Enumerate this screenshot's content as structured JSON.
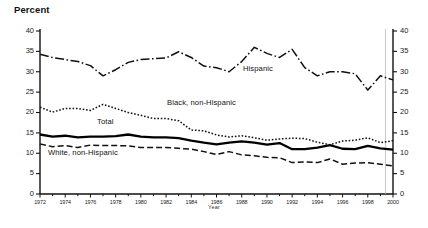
{
  "chart_data": {
    "type": "line",
    "title": "",
    "ylabel": "Percent",
    "xlabel": "Year",
    "ylim": [
      0,
      40
    ],
    "xlim": [
      1972,
      2000
    ],
    "ytick_labels": [
      "40",
      "35",
      "30",
      "25",
      "20",
      "15",
      "10",
      "5",
      "0"
    ],
    "ytick_values": [
      40,
      35,
      30,
      25,
      20,
      15,
      10,
      5,
      0
    ],
    "right_axis": true,
    "right_ytick_labels": [
      "40",
      "35",
      "30",
      "25",
      "20",
      "15",
      "10",
      "5",
      "0"
    ],
    "xtick_labels": [
      "1972",
      "1974",
      "1976",
      "1978",
      "1980",
      "1982",
      "1984",
      "1986",
      "1988",
      "1990",
      "1992",
      "1994",
      "1996",
      "1998",
      "2000"
    ],
    "xtick_values": [
      1972,
      1974,
      1976,
      1978,
      1980,
      1982,
      1984,
      1986,
      1988,
      1990,
      1992,
      1994,
      1996,
      1998,
      2000
    ],
    "grid": false,
    "legend_position": "inline-annotations",
    "x": [
      1972,
      1973,
      1974,
      1975,
      1976,
      1977,
      1978,
      1979,
      1980,
      1981,
      1982,
      1983,
      1984,
      1985,
      1986,
      1987,
      1988,
      1989,
      1990,
      1991,
      1992,
      1993,
      1994,
      1995,
      1996,
      1997,
      1998,
      1999,
      2000
    ],
    "series": [
      {
        "name": "Hispanic",
        "label": "Hispanic",
        "style": "dash-dot",
        "color": "#111111",
        "values": [
          34.3,
          33.5,
          33.0,
          32.5,
          31.5,
          29.0,
          30.5,
          32.3,
          33.0,
          33.2,
          33.4,
          34.9,
          33.5,
          31.4,
          31.0,
          30.0,
          32.5,
          36.0,
          34.5,
          33.5,
          35.5,
          31.0,
          29.0,
          30.0,
          30.0,
          29.5,
          25.5,
          29.0,
          28.0
        ]
      },
      {
        "name": "Black, non-Hispanic",
        "label": "Black, non-Hispanic",
        "style": "dotted",
        "color": "#111111",
        "values": [
          21.3,
          20.1,
          21.0,
          21.0,
          20.5,
          22.0,
          21.0,
          20.0,
          19.3,
          18.5,
          18.5,
          18.0,
          15.7,
          15.5,
          14.5,
          14.0,
          14.3,
          13.8,
          13.2,
          13.5,
          13.7,
          13.6,
          12.7,
          12.1,
          13.0,
          13.2,
          13.8,
          12.6,
          13.1
        ]
      },
      {
        "name": "Total",
        "label": "Total",
        "style": "solid-thick",
        "color": "#000000",
        "values": [
          14.6,
          14.1,
          14.3,
          13.9,
          14.1,
          14.1,
          14.2,
          14.6,
          14.1,
          13.9,
          13.9,
          13.7,
          13.1,
          12.6,
          12.2,
          12.6,
          12.9,
          12.6,
          12.1,
          12.5,
          11.0,
          11.0,
          11.4,
          12.0,
          11.1,
          11.0,
          11.8,
          11.2,
          10.9
        ]
      },
      {
        "name": "White, non-Hispanic",
        "label": "White, non-Hispanic",
        "style": "dashed",
        "color": "#111111",
        "values": [
          12.3,
          11.6,
          11.9,
          11.4,
          12.0,
          11.9,
          11.9,
          11.8,
          11.4,
          11.4,
          11.4,
          11.2,
          11.0,
          10.4,
          9.7,
          10.4,
          9.6,
          9.4,
          9.0,
          8.9,
          7.7,
          7.9,
          7.7,
          8.6,
          7.3,
          7.6,
          7.7,
          7.3,
          6.9
        ]
      }
    ]
  },
  "axis": {
    "y_title": "Percent",
    "x_title": "Year"
  }
}
